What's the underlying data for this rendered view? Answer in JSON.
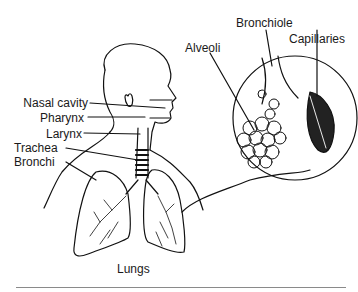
{
  "diagram": {
    "labels": {
      "nasal_cavity": "Nasal cavity",
      "pharynx": "Pharynx",
      "larynx": "Larynx",
      "trachea": "Trachea",
      "bronchi": "Bronchi",
      "lungs": "Lungs",
      "alveoli": "Alveoli",
      "bronchiole": "Bronchiole",
      "capillaries": "Capillaries"
    },
    "colors": {
      "line": "#111111",
      "background": "#ffffff",
      "rule": "#8a8a8a"
    }
  }
}
